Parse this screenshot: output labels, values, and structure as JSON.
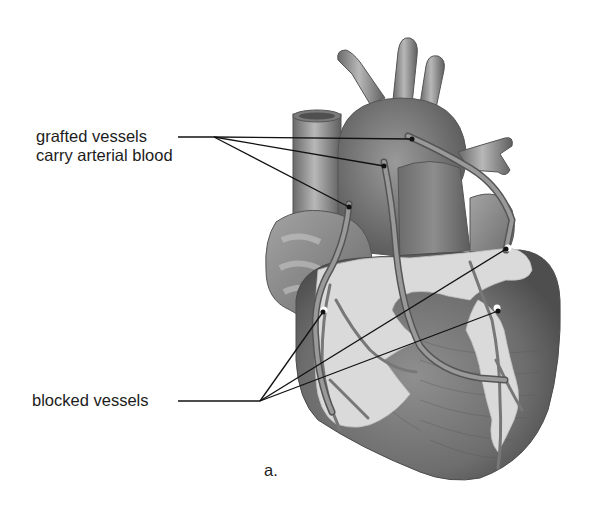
{
  "diagram": {
    "panel_label": "a.",
    "labels": {
      "grafted_line1": "grafted vessels",
      "grafted_line2": "carry arterial blood",
      "blocked": "blocked vessels"
    },
    "leaders": {
      "grafted": {
        "hub": [
          214,
          137
        ],
        "start": [
          178,
          137
        ],
        "targets": [
          [
            412,
            139
          ],
          [
            384,
            166
          ],
          [
            349,
            207
          ]
        ]
      },
      "blocked": {
        "hub": [
          260,
          401
        ],
        "start": [
          178,
          401
        ],
        "targets": [
          [
            323,
            312
          ],
          [
            506,
            249
          ],
          [
            498,
            311
          ]
        ]
      }
    },
    "colors": {
      "background": "#ffffff",
      "tissue_dark": "#5a5a5a",
      "tissue_mid": "#8a8a8a",
      "tissue_light": "#b5b5b5",
      "fat": "#dcdcdc",
      "leader_line": "#111111",
      "text": "#1c1c1c"
    }
  }
}
